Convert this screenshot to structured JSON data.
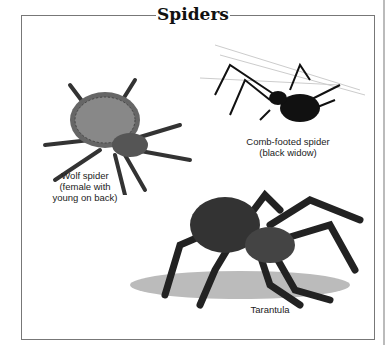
{
  "title": "Spiders",
  "figures": [
    {
      "name": "wolf-spider",
      "caption_lines": [
        "Wolf spider",
        "(female with",
        "young on back)"
      ]
    },
    {
      "name": "black-widow",
      "caption_lines": [
        "Comb-footed spider",
        "(black widow)"
      ]
    },
    {
      "name": "tarantula",
      "caption_lines": [
        "Tarantula"
      ]
    }
  ]
}
